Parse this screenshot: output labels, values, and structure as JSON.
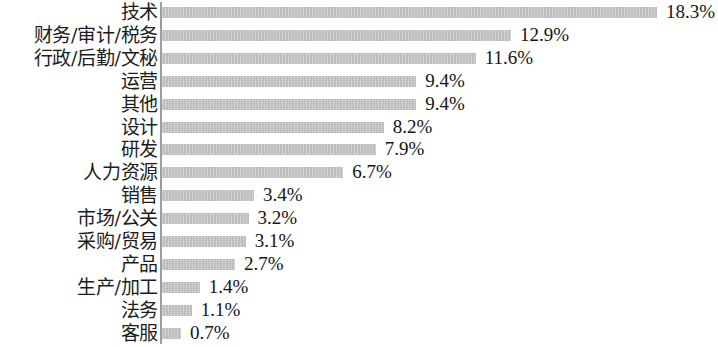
{
  "chart": {
    "type": "bar",
    "orientation": "horizontal",
    "axis_color": "#9d9d9d",
    "bar_color": "#c2c2c2",
    "text_color": "#1c1c1c"
  },
  "chart_data": {
    "type": "bar",
    "title": "",
    "xlabel": "",
    "ylabel": "",
    "orientation": "horizontal",
    "grid": false,
    "legend": false,
    "unit": "%",
    "xlim": [
      0,
      18.3
    ],
    "categories": [
      "技术",
      "财务/审计/税务",
      "行政/后勤/文秘",
      "运营",
      "其他",
      "设计",
      "研发",
      "人力资源",
      "销售",
      "市场/公关",
      "采购/贸易",
      "产品",
      "生产/加工",
      "法务",
      "客服"
    ],
    "values": [
      18.3,
      12.9,
      11.6,
      9.4,
      9.4,
      8.2,
      7.9,
      6.7,
      3.4,
      3.2,
      3.1,
      2.7,
      1.4,
      1.1,
      0.7
    ],
    "value_labels": [
      "18.3%",
      "12.9%",
      "11.6%",
      "9.4%",
      "9.4%",
      "8.2%",
      "7.9%",
      "6.7%",
      "3.4%",
      "3.2%",
      "3.1%",
      "2.7%",
      "1.4%",
      "1.1%",
      "0.7%"
    ]
  }
}
